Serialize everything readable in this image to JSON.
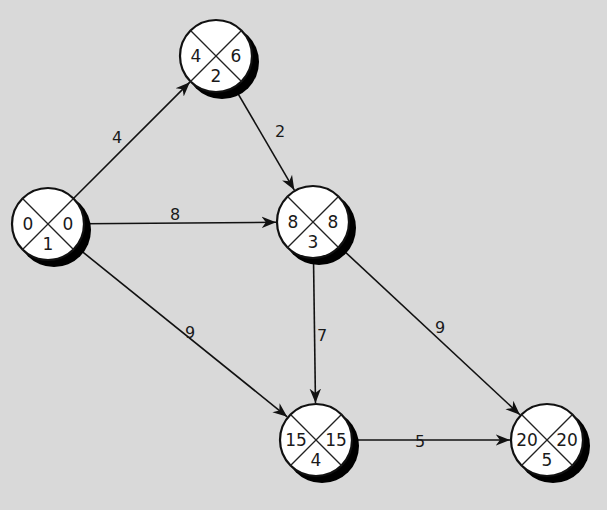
{
  "diagram": {
    "type": "network-node-diagram",
    "nodes": [
      {
        "id": "1",
        "cx": 48,
        "cy": 224,
        "left": "0",
        "right": "0",
        "bottom": "1"
      },
      {
        "id": "2",
        "cx": 216,
        "cy": 56,
        "left": "4",
        "right": "6",
        "bottom": "2"
      },
      {
        "id": "3",
        "cx": 313,
        "cy": 222,
        "left": "8",
        "right": "8",
        "bottom": "3"
      },
      {
        "id": "4",
        "cx": 316,
        "cy": 440,
        "left": "15",
        "right": "15",
        "bottom": "4"
      },
      {
        "id": "5",
        "cx": 547,
        "cy": 440,
        "left": "20",
        "right": "20",
        "bottom": "5"
      }
    ],
    "edges": [
      {
        "from": "1",
        "to": "2",
        "label": "4",
        "lx": 117,
        "ly": 138
      },
      {
        "from": "1",
        "to": "3",
        "label": "8",
        "lx": 175,
        "ly": 215
      },
      {
        "from": "1",
        "to": "4",
        "label": "9",
        "lx": 190,
        "ly": 333
      },
      {
        "from": "2",
        "to": "3",
        "label": "2",
        "lx": 280,
        "ly": 132
      },
      {
        "from": "3",
        "to": "4",
        "label": "7",
        "lx": 322,
        "ly": 336
      },
      {
        "from": "3",
        "to": "5",
        "label": "9",
        "lx": 440,
        "ly": 328
      },
      {
        "from": "4",
        "to": "5",
        "label": "5",
        "lx": 420,
        "ly": 442
      }
    ]
  },
  "colors": {
    "background": "#d9d9d9",
    "node_fill": "#ffffff",
    "stroke": "#111111",
    "shadow": "#000000"
  }
}
